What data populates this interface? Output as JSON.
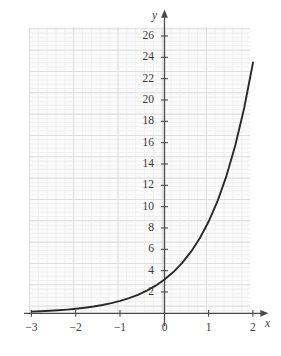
{
  "chart_data": {
    "type": "line",
    "title": "",
    "xlabel": "x",
    "ylabel": "y",
    "xlim": [
      -3,
      2.05
    ],
    "ylim": [
      -0.45,
      26.8
    ],
    "grid": true,
    "grid_minor": true,
    "legend": "none",
    "curve_description": "exponential growth curve passing through (0, 1) and (2, 25)",
    "x_ticks": [
      "-3",
      "-2",
      "-1",
      "0",
      "1",
      "2"
    ],
    "x_tick_values": [
      -3,
      -2,
      -1,
      0,
      1,
      2
    ],
    "y_ticks": [
      "2",
      "4",
      "6",
      "8",
      "10",
      "12",
      "14",
      "16",
      "18",
      "20",
      "22",
      "24",
      "26"
    ],
    "y_tick_values": [
      2,
      4,
      6,
      8,
      10,
      12,
      14,
      16,
      18,
      20,
      22,
      24,
      26
    ],
    "series": [
      {
        "name": "exponential",
        "x": [
          -3.0,
          -2.8,
          -2.6,
          -2.4,
          -2.2,
          -2.0,
          -1.8,
          -1.6,
          -1.4,
          -1.2,
          -1.0,
          -0.8,
          -0.6,
          -0.4,
          -0.2,
          0.0,
          0.2,
          0.4,
          0.6,
          0.8,
          1.0,
          1.2,
          1.4,
          1.6,
          1.8,
          2.0
        ],
        "y": [
          0.156,
          0.191,
          0.233,
          0.285,
          0.348,
          0.426,
          0.521,
          0.636,
          0.777,
          0.95,
          1.161,
          1.419,
          1.734,
          2.119,
          2.59,
          3.165,
          3.868,
          4.727,
          5.777,
          7.06,
          8.629,
          10.545,
          12.887,
          15.749,
          19.245,
          23.519
        ],
        "color": "#2a2a2a",
        "width": 1.9
      }
    ],
    "axis_colors": {
      "axis": "#4a4a4a",
      "grid_major": "#dedede",
      "grid_minor": "#efefef",
      "plot_bg": "#fbfbfb",
      "text": "#3b3b3b",
      "curve": "#2a2a2a"
    }
  },
  "labels": {
    "y_axis_name": "y",
    "x_axis_name": "x",
    "origin": "0",
    "y": {
      "t26": "26",
      "t24": "24",
      "t22": "22",
      "t20": "20",
      "t18": "18",
      "t16": "16",
      "t14": "14",
      "t12": "12",
      "t10": "10",
      "t8": "8",
      "t6": "6",
      "t4": "4",
      "t2": "2"
    },
    "x": {
      "m3": "−3",
      "m2": "−2",
      "m1": "−1",
      "p1": "1",
      "p2": "2"
    }
  }
}
